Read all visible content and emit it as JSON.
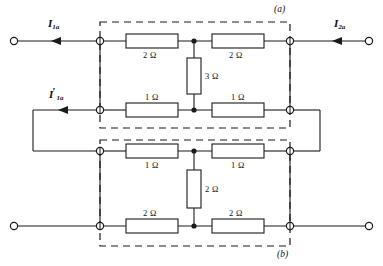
{
  "figure": {
    "subfigures": [
      {
        "id": "a",
        "label": "(a)",
        "x": 274,
        "y": 7
      },
      {
        "id": "b",
        "label": "(b)",
        "x": 277,
        "y": 252
      }
    ]
  },
  "currents": [
    {
      "name": "I1a",
      "label": "I",
      "sub": "1a",
      "prime": "",
      "x": 44,
      "y": 22,
      "direction": "right"
    },
    {
      "name": "I2a",
      "label": "I",
      "sub": "2a",
      "prime": "",
      "x": 331,
      "y": 22,
      "direction": "left"
    },
    {
      "name": "I1a_prime",
      "label": "I",
      "sub": "1a",
      "prime": "′",
      "x": 47,
      "y": 94,
      "direction": "left"
    }
  ],
  "network_a": {
    "name": "network-a",
    "box": {
      "x": 100,
      "y": 22,
      "w": 190,
      "h": 106
    },
    "resistors": [
      {
        "id": "a-top-left",
        "value": "2 Ω",
        "orientation": "horizontal",
        "cx": 152,
        "cy": 41,
        "label_x": 143,
        "label_y": 50
      },
      {
        "id": "a-top-right",
        "value": "2 Ω",
        "orientation": "horizontal",
        "cx": 238,
        "cy": 41,
        "label_x": 229,
        "label_y": 50
      },
      {
        "id": "a-shunt",
        "value": "3 Ω",
        "orientation": "vertical",
        "cx": 194,
        "cy": 76,
        "label_x": 203,
        "label_y": 72
      },
      {
        "id": "a-bot-left",
        "value": "1 Ω",
        "orientation": "horizontal",
        "cx": 152,
        "cy": 110,
        "label_x": 145,
        "label_y": 97
      },
      {
        "id": "a-bot-right",
        "value": "1 Ω",
        "orientation": "horizontal",
        "cx": 238,
        "cy": 110,
        "label_x": 231,
        "label_y": 97
      }
    ]
  },
  "network_b": {
    "name": "network-b",
    "box": {
      "x": 100,
      "y": 140,
      "w": 190,
      "h": 106
    },
    "resistors": [
      {
        "id": "b-top-left",
        "value": "1 Ω",
        "orientation": "horizontal",
        "cx": 152,
        "cy": 151,
        "label_x": 145,
        "label_y": 160
      },
      {
        "id": "b-top-right",
        "value": "1 Ω",
        "orientation": "horizontal",
        "cx": 238,
        "cy": 151,
        "label_x": 231,
        "label_y": 160
      },
      {
        "id": "b-shunt",
        "value": "2 Ω",
        "orientation": "vertical",
        "cx": 194,
        "cy": 189,
        "label_x": 203,
        "label_y": 185
      },
      {
        "id": "b-bot-left",
        "value": "2 Ω",
        "orientation": "horizontal",
        "cx": 152,
        "cy": 226,
        "label_x": 143,
        "label_y": 213
      },
      {
        "id": "b-bot-right",
        "value": "2 Ω",
        "orientation": "horizontal",
        "cx": 238,
        "cy": 226,
        "label_x": 229,
        "label_y": 213
      }
    ]
  },
  "terminals": {
    "open_circles": [
      {
        "id": "in-top-left",
        "cx": 14,
        "cy": 41
      },
      {
        "id": "out-top-right",
        "cx": 369,
        "cy": 41
      },
      {
        "id": "in-bot-left",
        "cx": 14,
        "cy": 226
      },
      {
        "id": "out-bot-right",
        "cx": 369,
        "cy": 226
      }
    ],
    "port_nodes": [
      {
        "id": "a-port1-top",
        "cx": 100,
        "cy": 41
      },
      {
        "id": "a-port2-top",
        "cx": 290,
        "cy": 41
      },
      {
        "id": "a-port1-bot",
        "cx": 100,
        "cy": 110
      },
      {
        "id": "a-port2-bot",
        "cx": 290,
        "cy": 110
      },
      {
        "id": "b-port1-top",
        "cx": 100,
        "cy": 151
      },
      {
        "id": "b-port2-top",
        "cx": 290,
        "cy": 151
      },
      {
        "id": "b-port1-bot",
        "cx": 100,
        "cy": 226
      },
      {
        "id": "b-port2-bot",
        "cx": 290,
        "cy": 226
      }
    ],
    "junction_dots": [
      {
        "id": "a-mid-top",
        "cx": 194,
        "cy": 41
      },
      {
        "id": "a-mid-bot",
        "cx": 194,
        "cy": 110
      },
      {
        "id": "b-mid-top",
        "cx": 194,
        "cy": 151
      },
      {
        "id": "b-mid-bot",
        "cx": 194,
        "cy": 226
      }
    ]
  },
  "colors": {
    "wire": "#1a1a1a",
    "dashed_box": "#1a1a1a",
    "background": "#ffffff",
    "text": "#111111"
  }
}
